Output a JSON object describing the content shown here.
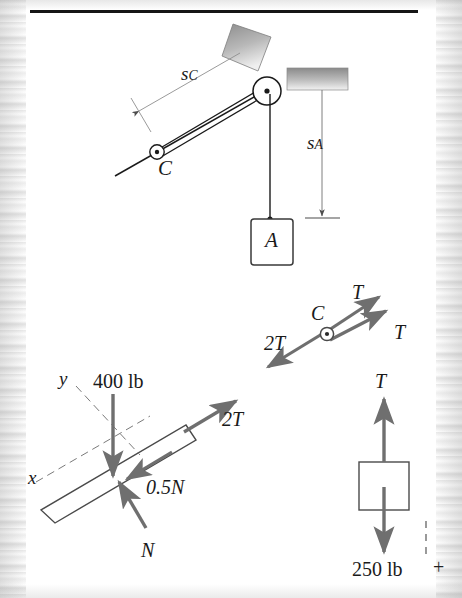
{
  "page": {
    "background_color": "#ffffff",
    "ink_color": "#1a1a1a",
    "arrow_color": "#6f6f6f",
    "rule_color": "#151515"
  },
  "rule": {
    "name": "top-horizontal-rule"
  },
  "system_diagram": {
    "name": "pulley-system-diagram",
    "labels": {
      "s_c": "s",
      "s_c_sub": "C",
      "s_a": "s",
      "s_a_sub": "A",
      "pulley_c": "C",
      "block_a": "A"
    }
  },
  "pulley_fbd": {
    "name": "pulley-c-free-body-diagram",
    "labels": {
      "center": "C",
      "tension_upper": "T",
      "tension_lower": "T",
      "resultant": "2T"
    }
  },
  "block_fbd": {
    "name": "inclined-block-free-body-diagram",
    "labels": {
      "weight": "400 lb",
      "tension": "2T",
      "friction": "0.5N",
      "normal": "N",
      "axis_x": "x",
      "axis_y": "y"
    }
  },
  "weight_fbd": {
    "name": "block-a-free-body-diagram",
    "labels": {
      "tension": "T",
      "weight": "250 lb",
      "sign_convention": "+"
    }
  }
}
